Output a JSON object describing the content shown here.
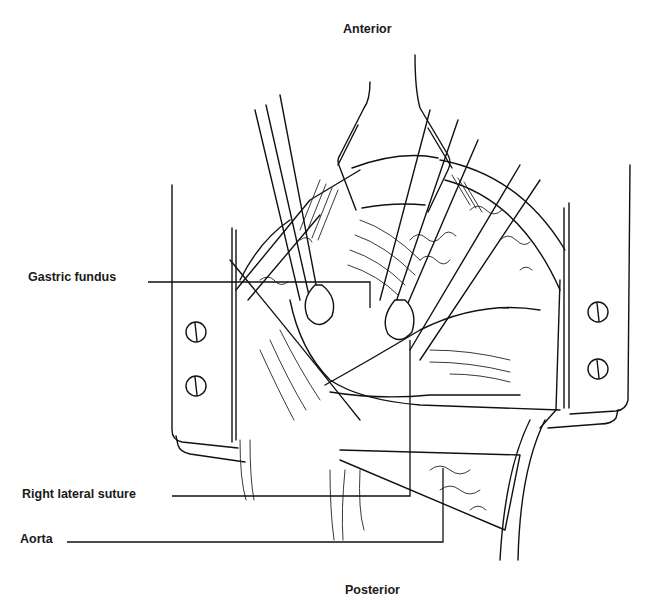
{
  "figure": {
    "type": "surgical-illustration",
    "orientation": {
      "top": "Anterior",
      "bottom": "Posterior"
    },
    "labels": [
      {
        "id": "gastric-fundus",
        "text": "Gastric fundus"
      },
      {
        "id": "right-lateral-suture",
        "text": "Right lateral suture"
      },
      {
        "id": "aorta",
        "text": "Aorta"
      }
    ],
    "colors": {
      "ink": "#111111",
      "background": "#ffffff"
    }
  }
}
